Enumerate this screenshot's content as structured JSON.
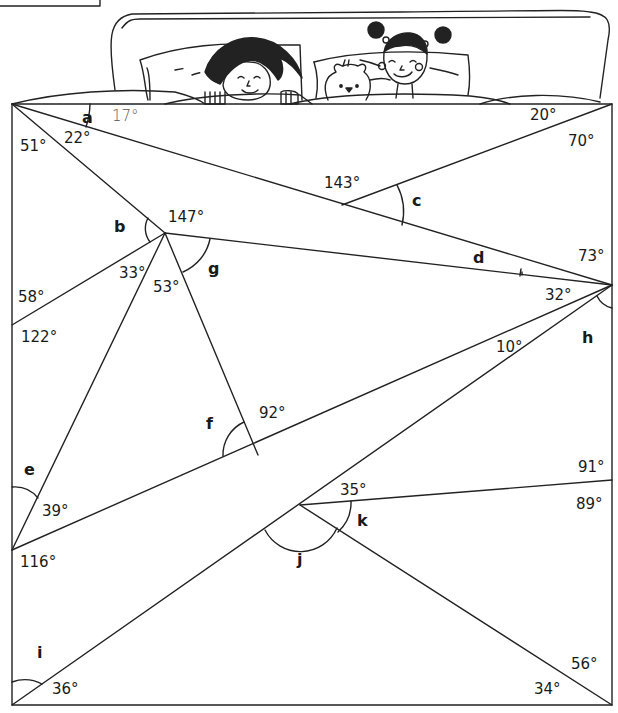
{
  "figure": {
    "illustration": {
      "description": "Two children sleeping in a bed with a teddy bear; the bed covers form a large rectangle containing straight lines and angles",
      "characters": [
        "girl-with-long-hair",
        "teddy-bear",
        "girl-with-puffs"
      ]
    },
    "stroke_color": "#222222",
    "background_color": "#ffffff"
  },
  "angles": {
    "known": {
      "top_left_a_adjacent": "17°",
      "top_left_inner": "22°",
      "top_left_outer": "51°",
      "top_right_top": "20°",
      "top_right_side": "70°",
      "center_c_adjacent": "143°",
      "point_b_147": "147°",
      "right_73": "73°",
      "right_32": "32°",
      "left_58": "58°",
      "left_122": "122°",
      "point_33": "33°",
      "point_53": "53°",
      "f_92": "92°",
      "h_10": "10°",
      "left_39": "39°",
      "left_116": "116°",
      "k_35": "35°",
      "right_91": "91°",
      "right_89": "89°",
      "bottom_left_36": "36°",
      "bottom_right_56": "56°",
      "bottom_right_34": "34°"
    },
    "unknown": {
      "a": "a",
      "b": "b",
      "c": "c",
      "d": "d",
      "e": "e",
      "f": "f",
      "g": "g",
      "h": "h",
      "i": "i",
      "j": "j",
      "k": "k"
    }
  }
}
